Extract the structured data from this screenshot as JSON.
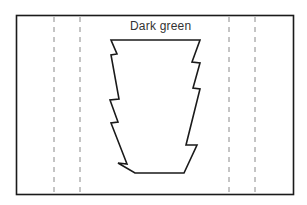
{
  "diagram": {
    "label": "Dark green",
    "colors": {
      "outline": "#1a1a1a",
      "dashed_line": "#8a8a8a",
      "text": "#333333",
      "background": "#ffffff"
    },
    "frame": {
      "x": 16,
      "y": 15,
      "width": 277,
      "height": 179
    },
    "dashed_lines_x": [
      54,
      80,
      229,
      255
    ],
    "shape_points": "111,40 200,40 192,62 200,63 193,88 200,89 186,145 197,145 184,173 135,173 118,163 127,164 111,123 118,122 110,100 119,99 111,55 117,54"
  }
}
